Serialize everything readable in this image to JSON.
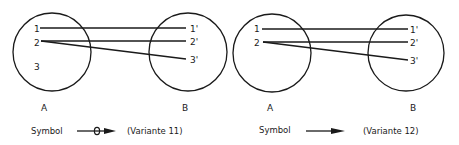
{
  "diagrams": [
    {
      "id": "variante-11",
      "set_a": {
        "label": "A",
        "elements": [
          "1",
          "2",
          "3"
        ]
      },
      "set_b": {
        "label": "B",
        "elements": [
          "1'",
          "2'",
          "3'"
        ]
      },
      "mappings": [
        [
          "1",
          "1'"
        ],
        [
          "2",
          "2'"
        ],
        [
          "2",
          "3'"
        ]
      ],
      "legend": {
        "symbol_label": "Symbol",
        "variant_label": "(Variante 11)",
        "arrow_style": "arrow-with-crossbar"
      }
    },
    {
      "id": "variante-12",
      "set_a": {
        "label": "A",
        "elements": [
          "1",
          "2"
        ]
      },
      "set_b": {
        "label": "B",
        "elements": [
          "1'",
          "2'",
          "3'"
        ]
      },
      "mappings": [
        [
          "1",
          "1'"
        ],
        [
          "2",
          "2'"
        ],
        [
          "2",
          "3'"
        ]
      ],
      "legend": {
        "symbol_label": "Symbol",
        "variant_label": "(Variante 12)",
        "arrow_style": "plain-arrow"
      }
    }
  ],
  "colors": {
    "stroke": "#1a1a1a",
    "background": "#ffffff"
  }
}
